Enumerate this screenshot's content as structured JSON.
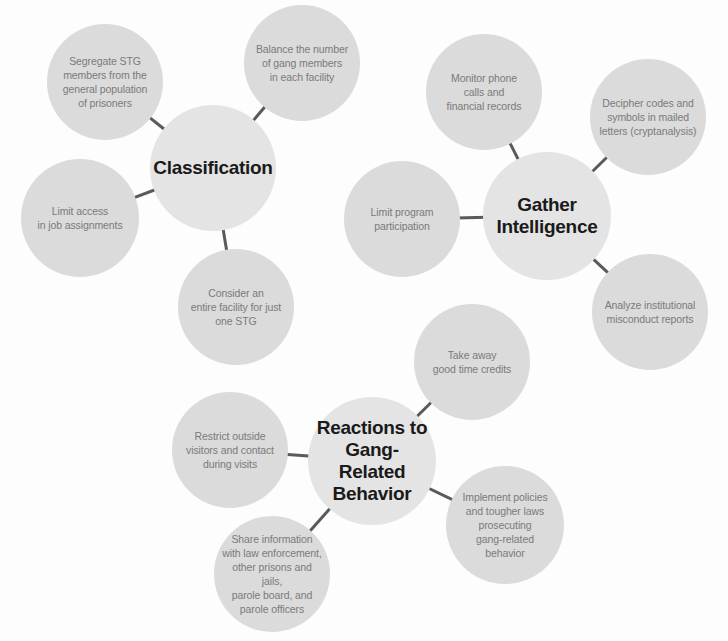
{
  "diagram": {
    "colors": {
      "background": "#fdfdfd",
      "hub_fill": "#e4e4e4",
      "leaf_fill": "#dbdbdb",
      "hub_text": "#1a1a1a",
      "leaf_text": "#7a7a7a",
      "connector": "#5a5a5a"
    },
    "clusters": [
      {
        "id": "classification",
        "hub": {
          "label": "Classification",
          "cx": 213,
          "cy": 168,
          "r": 63
        },
        "leaves": [
          {
            "label": "Segregate STG\nmembers from the\ngeneral population\nof prisoners",
            "cx": 105,
            "cy": 82,
            "r": 58
          },
          {
            "label": "Balance the number\nof gang members\nin each facility",
            "cx": 302,
            "cy": 63,
            "r": 58
          },
          {
            "label": "Limit access\nin job assignments",
            "cx": 80,
            "cy": 218,
            "r": 59
          },
          {
            "label": "Consider an\nentire facility for just\none STG",
            "cx": 236,
            "cy": 307,
            "r": 58
          }
        ]
      },
      {
        "id": "gather-intelligence",
        "hub": {
          "label": "Gather\nIntelligence",
          "cx": 547,
          "cy": 216,
          "r": 64
        },
        "leaves": [
          {
            "label": "Monitor phone\ncalls and\nfinancial records",
            "cx": 484,
            "cy": 92,
            "r": 58
          },
          {
            "label": "Decipher codes and\nsymbols in mailed\nletters (cryptanalysis)",
            "cx": 648,
            "cy": 117,
            "r": 58
          },
          {
            "label": "Limit program\nparticipation",
            "cx": 402,
            "cy": 219,
            "r": 58
          },
          {
            "label": "Analyze institutional\nmisconduct reports",
            "cx": 650,
            "cy": 312,
            "r": 58
          }
        ]
      },
      {
        "id": "reactions",
        "hub": {
          "label": "Reactions to\nGang-Related\nBehavior",
          "cx": 372,
          "cy": 461,
          "r": 64
        },
        "leaves": [
          {
            "label": "Take away\ngood time credits",
            "cx": 472,
            "cy": 362,
            "r": 58
          },
          {
            "label": "Restrict outside\nvisitors and contact\nduring visits",
            "cx": 230,
            "cy": 450,
            "r": 58
          },
          {
            "label": "Implement policies\nand tougher laws\nprosecuting\ngang-related\nbehavior",
            "cx": 505,
            "cy": 525,
            "r": 59
          },
          {
            "label": "Share information\nwith law enforcement,\nother prisons and jails,\nparole board, and\nparole officers",
            "cx": 272,
            "cy": 574,
            "r": 58
          }
        ]
      }
    ]
  }
}
